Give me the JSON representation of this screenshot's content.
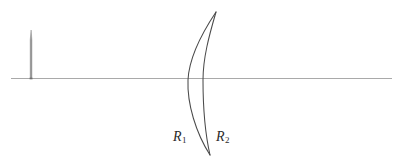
{
  "figure": {
    "type": "optics-ray-diagram",
    "background_color": "#ffffff",
    "width": 400,
    "height": 162
  },
  "colors": {
    "axis": "#a9a9a9",
    "lens_outline": "#4a4a4a",
    "object_arrow": "#8a8a8a",
    "label": "#2b2b2b"
  },
  "optical_axis": {
    "name": "optical-axis",
    "x_start": 11,
    "x_end": 392,
    "y": 78,
    "stroke_width": 1.1
  },
  "object_arrow": {
    "name": "object-arrow",
    "x": 31,
    "y_base": 78,
    "y_tip": 30,
    "height": 48,
    "direction": "up"
  },
  "lens": {
    "name": "meniscus-lens",
    "shape": "meniscus",
    "vertex_top": {
      "x": 216,
      "y": 12
    },
    "vertex_bottom": {
      "x": 210,
      "y": 155
    },
    "first_surface": {
      "name": "lens-surface-r1",
      "axis_crossing_x": 188,
      "label": "R1"
    },
    "second_surface": {
      "name": "lens-surface-r2",
      "axis_crossing_x": 203,
      "label": "R2"
    }
  },
  "labels": {
    "r1": {
      "letter": "R",
      "subscript": "1"
    },
    "r2": {
      "letter": "R",
      "subscript": "2"
    }
  }
}
